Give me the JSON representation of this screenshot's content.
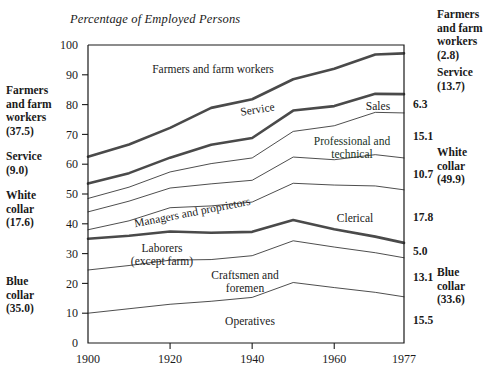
{
  "chart_title": "Percentage of Employed Persons",
  "left_labels": [
    {
      "name": "farmers-and-farm-workers",
      "text": "Farmers\nand farm\nworkers\n(37.5)",
      "top": 84
    },
    {
      "name": "service",
      "text": "Service\n(9.0)",
      "top": 150
    },
    {
      "name": "white-collar",
      "text": "White\ncollar\n(17.6)",
      "top": 189
    },
    {
      "name": "blue-collar",
      "text": "Blue\ncollar\n(35.0)",
      "top": 275
    }
  ],
  "right_labels": [
    {
      "name": "farmers-and-farm-workers",
      "text": "Farmers\nand farm\nworkers\n(2.8)",
      "top": 8
    },
    {
      "name": "service",
      "text": "Service\n(13.7)",
      "top": 66
    },
    {
      "name": "white-collar",
      "text": "White\ncollar\n(49.9)",
      "top": 146
    },
    {
      "name": "blue-collar",
      "text": "Blue\ncollar\n(33.6)",
      "top": 266
    }
  ],
  "chart_data": {
    "type": "area",
    "title": "Percentage of Employed Persons",
    "xlabel": "",
    "ylabel": "",
    "ylim": [
      0,
      100
    ],
    "xlim": [
      1900,
      1977
    ],
    "grid": false,
    "legend": "inline-labels",
    "yticks": [
      0,
      10,
      20,
      30,
      40,
      50,
      60,
      70,
      80,
      90,
      100
    ],
    "xticks": [
      1900,
      1920,
      1940,
      1960,
      1977
    ],
    "xtick_labels": [
      "1900",
      "1920",
      "1940",
      "1960",
      "1977"
    ],
    "x": [
      1900,
      1910,
      1920,
      1930,
      1940,
      1950,
      1960,
      1970,
      1977
    ],
    "stack_order_bottom_to_top": [
      "Operatives",
      "Craftsmen and foremen",
      "Laborers (except farm)",
      "Clerical",
      "Managers and proprietors",
      "Professional and technical",
      "Sales",
      "Service",
      "Farmers and farm workers"
    ],
    "series": [
      {
        "name": "Operatives",
        "group": "Blue collar",
        "values": [
          10.0,
          11.5,
          13.0,
          14.0,
          15.3,
          20.3,
          18.6,
          17.0,
          15.5
        ],
        "start": 10.0,
        "end": 15.5,
        "boundary": "thin"
      },
      {
        "name": "Craftsmen and foremen",
        "group": "Blue collar",
        "values": [
          14.5,
          14.5,
          14.8,
          14.0,
          14.0,
          14.0,
          13.6,
          13.3,
          13.1
        ],
        "start": 14.5,
        "end": 13.1,
        "boundary": "thin"
      },
      {
        "name": "Laborers (except farm)",
        "group": "Blue collar",
        "values": [
          10.5,
          10.0,
          9.6,
          9.0,
          8.0,
          7.0,
          6.0,
          5.4,
          5.0
        ],
        "start": 10.5,
        "end": 5.0,
        "boundary": "thick"
      },
      {
        "name": "Clerical",
        "group": "White collar",
        "values": [
          3.0,
          5.0,
          8.0,
          9.0,
          10.0,
          12.3,
          14.8,
          17.0,
          17.8
        ],
        "start": 3.0,
        "end": 17.8,
        "boundary": "thin"
      },
      {
        "name": "Managers and proprietors",
        "group": "White collar",
        "values": [
          6.0,
          6.6,
          6.6,
          7.4,
          7.3,
          8.8,
          8.5,
          10.5,
          10.7
        ],
        "start": 6.0,
        "end": 10.7,
        "boundary": "thin"
      },
      {
        "name": "Professional and technical",
        "group": "White collar",
        "values": [
          4.5,
          4.7,
          5.4,
          6.8,
          7.5,
          8.6,
          11.4,
          14.2,
          15.1
        ],
        "start": 4.5,
        "end": 15.1,
        "boundary": "thin"
      },
      {
        "name": "Sales",
        "group": "White collar",
        "values": [
          5.0,
          4.7,
          4.8,
          6.3,
          6.7,
          7.0,
          6.6,
          6.2,
          6.3
        ],
        "start": 5.0,
        "end": 6.3,
        "boundary": "thick"
      },
      {
        "name": "Service",
        "group": "Service",
        "values": [
          9.0,
          9.6,
          10.0,
          12.4,
          13.0,
          10.5,
          12.5,
          13.2,
          13.7
        ],
        "start": 9.0,
        "end": 13.7,
        "boundary": "thick"
      },
      {
        "name": "Farmers and farm workers",
        "group": "Farmers",
        "values": [
          37.5,
          33.4,
          27.8,
          21.1,
          18.2,
          11.5,
          7.9,
          3.2,
          2.8
        ],
        "start": 37.5,
        "end": 2.8,
        "boundary": "frame-top"
      }
    ],
    "right_axis_band_values": [
      {
        "label": "6.3",
        "series": "Sales"
      },
      {
        "label": "15.1",
        "series": "Professional and technical"
      },
      {
        "label": "10.7",
        "series": "Managers and proprietors"
      },
      {
        "label": "17.8",
        "series": "Clerical"
      },
      {
        "label": "5.0",
        "series": "Laborers (except farm)"
      },
      {
        "label": "13.1",
        "series": "Craftsmen and foremen"
      },
      {
        "label": "15.5",
        "series": "Operatives"
      }
    ],
    "group_totals_1900": {
      "Farmers and farm workers": 37.5,
      "Service": 9.0,
      "White collar": 17.6,
      "Blue collar": 35.0
    },
    "group_totals_1977": {
      "Farmers and farm workers": 2.8,
      "Service": 13.7,
      "White collar": 49.9,
      "Blue collar": 33.6
    }
  },
  "ytick_labels": [
    "100",
    "90",
    "80",
    "70",
    "60",
    "50",
    "40",
    "30",
    "20",
    "10",
    "0"
  ],
  "xtick_labels": [
    "1900",
    "1920",
    "1940",
    "1960",
    "1977"
  ],
  "inline_labels": [
    {
      "name": "farmers-and-farm-workers",
      "text": "Farmers and farm workers",
      "x": 213,
      "y": 73,
      "rot": 0,
      "tinted": false
    },
    {
      "name": "service",
      "text": "Service",
      "x": 258,
      "y": 113,
      "rot": -9,
      "tinted": false
    },
    {
      "name": "sales",
      "text": "Sales",
      "x": 378,
      "y": 110,
      "rot": 0,
      "tinted": false
    },
    {
      "name": "professional-and-technical-line1",
      "text": "Professional and",
      "x": 352,
      "y": 145,
      "rot": 0,
      "tinted": true
    },
    {
      "name": "professional-and-technical-line2",
      "text": "technical",
      "x": 352,
      "y": 158,
      "rot": 0,
      "tinted": true
    },
    {
      "name": "managers-and-proprietors",
      "text": "Managers and proprietors",
      "x": 193,
      "y": 216,
      "rot": -11,
      "tinted": false
    },
    {
      "name": "clerical",
      "text": "Clerical",
      "x": 355,
      "y": 222,
      "rot": 0,
      "tinted": false
    },
    {
      "name": "laborers-line1",
      "text": "Laborers",
      "x": 162,
      "y": 252,
      "rot": 0,
      "tinted": false
    },
    {
      "name": "laborers-line2",
      "text": "(except farm)",
      "x": 162,
      "y": 265,
      "rot": 0,
      "tinted": false
    },
    {
      "name": "craftsmen-line1",
      "text": "Craftsmen and",
      "x": 245,
      "y": 279,
      "rot": 0,
      "tinted": false
    },
    {
      "name": "craftsmen-line2",
      "text": "foremen",
      "x": 245,
      "y": 292,
      "rot": 0,
      "tinted": false
    },
    {
      "name": "operatives",
      "text": "Operatives",
      "x": 250,
      "y": 325,
      "rot": 0,
      "tinted": false
    }
  ],
  "geometry": {
    "plot_left": 88,
    "plot_right": 404,
    "plot_top": 45,
    "plot_bottom": 343,
    "y_min": 0,
    "y_max": 100,
    "x_min": 1900,
    "x_max": 1977
  },
  "colors": {
    "ink": "#1a1a1a",
    "thin_line": "#3a3a3a",
    "thick_line": "#4a4a4a",
    "tinted_text": "#20331f",
    "background": "#ffffff"
  }
}
